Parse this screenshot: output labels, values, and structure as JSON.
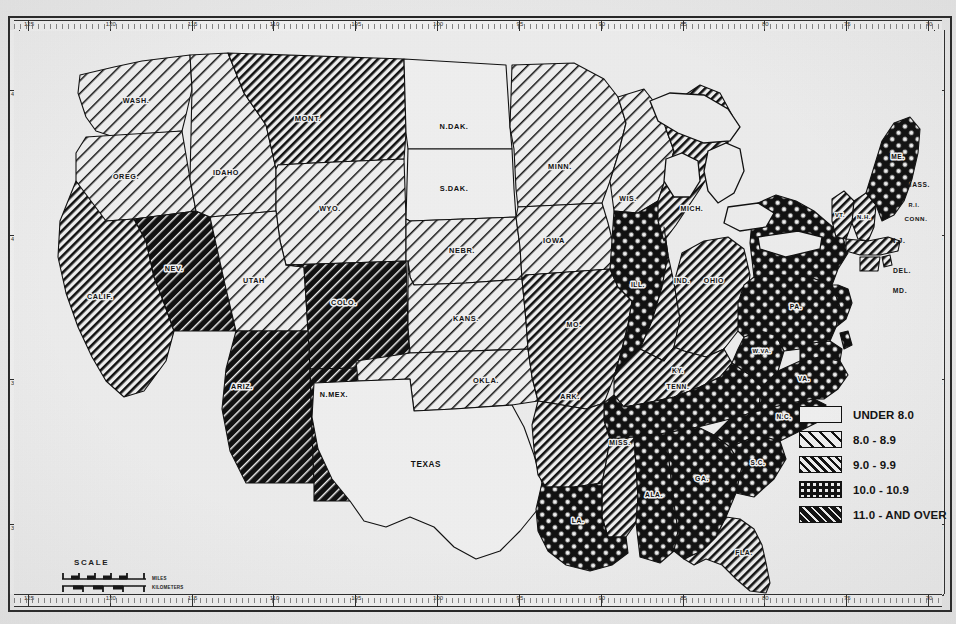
{
  "map": {
    "title": "United States choropleth map",
    "subject": "rate by state",
    "background_color": "#e9e9e9",
    "ink_color": "#111111"
  },
  "legend": {
    "title": "",
    "tick_marker": "legend-tick",
    "items": [
      {
        "label": "UNDER 8.0",
        "pattern": "blank",
        "swatch_name": "legend-swatch-under-8"
      },
      {
        "label": "8.0 -   8.9",
        "pattern": "hatch-light",
        "swatch_name": "legend-swatch-8-0-8-9"
      },
      {
        "label": "9.0 -   9.9",
        "pattern": "hatch-med",
        "swatch_name": "legend-swatch-9-0-9-9"
      },
      {
        "label": "10.0 - 10.9",
        "pattern": "crosshatch",
        "swatch_name": "legend-swatch-10-0-10-9"
      },
      {
        "label": "11.0 - AND OVER",
        "pattern": "solid-dark",
        "swatch_name": "legend-swatch-11-0-and-over"
      }
    ]
  },
  "scale": {
    "title": "SCALE",
    "unit_top": "MILES",
    "unit_bottom": "KILOMETERS",
    "miles_ticks": [
      "0",
      "100",
      "200",
      "300",
      "400",
      "500"
    ],
    "km_ticks": [
      "0",
      "200",
      "400",
      "600",
      "800"
    ]
  },
  "rulers": {
    "top_label_prefix": "",
    "top_labels": [
      "125",
      "120",
      "115",
      "110",
      "105",
      "100",
      "95",
      "90",
      "85",
      "80",
      "75",
      "70"
    ],
    "bottom_labels": [
      "125",
      "120",
      "115",
      "110",
      "105",
      "100",
      "95",
      "90",
      "85",
      "80",
      "75",
      "70"
    ],
    "left_labels": [
      "45",
      "40",
      "35",
      "30"
    ],
    "right_labels": [
      "45",
      "40",
      "35",
      "30"
    ]
  },
  "ghost_text": [
    {
      "text": "s a whole. The greatest",
      "x": 560,
      "y": 470
    },
    {
      "text": "in the period. Decline were",
      "x": 560,
      "y": 492
    },
    {
      "text": "and construction during the",
      "x": 520,
      "y": 514
    },
    {
      "text": "and service trade employment",
      "x": 470,
      "y": 536
    },
    {
      "text": "(Table 2).",
      "x": 560,
      "y": 558
    }
  ],
  "chart_data": {
    "type": "map",
    "legend_title": "",
    "categories": [
      "UNDER 8.0",
      "8.0 - 8.9",
      "9.0 - 9.9",
      "10.0 - 10.9",
      "11.0 AND OVER"
    ],
    "category_patterns": [
      "blank",
      "hatch-light",
      "hatch-med",
      "crosshatch",
      "solid-dark"
    ],
    "states": [
      {
        "code": "WASH",
        "label": "WASH.",
        "class": 1
      },
      {
        "code": "OREG",
        "label": "OREG.",
        "class": 1
      },
      {
        "code": "IDAHO",
        "label": "IDAHO",
        "class": 1
      },
      {
        "code": "MONT",
        "label": "MONT.",
        "class": 2
      },
      {
        "code": "WYO",
        "label": "WYO.",
        "class": 1
      },
      {
        "code": "NDAK",
        "label": "N.DAK.",
        "class": 0
      },
      {
        "code": "SDAK",
        "label": "S.DAK.",
        "class": 0
      },
      {
        "code": "NEBR",
        "label": "NEBR.",
        "class": 1
      },
      {
        "code": "KANS",
        "label": "KANS.",
        "class": 1
      },
      {
        "code": "MINN",
        "label": "MINN.",
        "class": 1
      },
      {
        "code": "IOWA",
        "label": "IOWA",
        "class": 1
      },
      {
        "code": "WIS",
        "label": "WIS.",
        "class": 1
      },
      {
        "code": "MO",
        "label": "MO.",
        "class": 2
      },
      {
        "code": "OKLA",
        "label": "OKLA.",
        "class": 1
      },
      {
        "code": "TEXAS",
        "label": "TEXAS",
        "class": 0
      },
      {
        "code": "CALIF",
        "label": "CALIF.",
        "class": 2
      },
      {
        "code": "NEV",
        "label": "NEV.",
        "class": 4
      },
      {
        "code": "UTAH",
        "label": "UTAH",
        "class": 1
      },
      {
        "code": "COLO",
        "label": "COLO.",
        "class": 4
      },
      {
        "code": "ARIZ",
        "label": "ARIZ.",
        "class": 4
      },
      {
        "code": "NMEX",
        "label": "N.MEX.",
        "class": 4
      },
      {
        "code": "ARK",
        "label": "ARK.",
        "class": 2
      },
      {
        "code": "MISS",
        "label": "MISS.",
        "class": 2
      },
      {
        "code": "LA",
        "label": "LA.",
        "class": 3
      },
      {
        "code": "ILL",
        "label": "ILL.",
        "class": 3
      },
      {
        "code": "IND",
        "label": "IND.",
        "class": 2
      },
      {
        "code": "OHIO",
        "label": "OHIO",
        "class": 2
      },
      {
        "code": "MICH",
        "label": "MICH.",
        "class": 2
      },
      {
        "code": "KY",
        "label": "KY.",
        "class": 2
      },
      {
        "code": "TENN",
        "label": "TENN.",
        "class": 3
      },
      {
        "code": "ALA",
        "label": "ALA.",
        "class": 3
      },
      {
        "code": "GA",
        "label": "GA.",
        "class": 3
      },
      {
        "code": "FLA",
        "label": "FLA.",
        "class": 2
      },
      {
        "code": "SC",
        "label": "S.C.",
        "class": 3
      },
      {
        "code": "NC",
        "label": "N.C.",
        "class": 3
      },
      {
        "code": "VA",
        "label": "VA.",
        "class": 3
      },
      {
        "code": "WVA",
        "label": "W.VA.",
        "class": 3
      },
      {
        "code": "PA",
        "label": "PA.",
        "class": 3
      },
      {
        "code": "NY",
        "label": "N.Y.",
        "class": 3
      },
      {
        "code": "VT",
        "label": "VT.",
        "class": 2
      },
      {
        "code": "NH",
        "label": "N.H.",
        "class": 2
      },
      {
        "code": "ME",
        "label": "ME.",
        "class": 3
      },
      {
        "code": "MASS",
        "label": "MASS.",
        "class": 2
      },
      {
        "code": "RI",
        "label": "R.I.",
        "class": 2
      },
      {
        "code": "CONN",
        "label": "CONN.",
        "class": 2
      },
      {
        "code": "NJ",
        "label": "N.J.",
        "class": 3
      },
      {
        "code": "DEL",
        "label": "DEL.",
        "class": 3
      },
      {
        "code": "MD",
        "label": "MD.",
        "class": 3
      }
    ]
  }
}
